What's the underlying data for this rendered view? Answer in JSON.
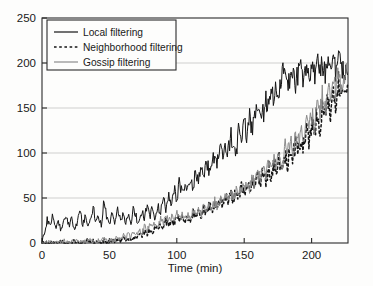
{
  "chart_data": {
    "type": "line",
    "title": "",
    "xlabel": "Time (min)",
    "ylabel": "",
    "xlim": [
      0,
      227
    ],
    "ylim": [
      0,
      250
    ],
    "xticks": [
      0,
      50,
      100,
      150,
      200
    ],
    "yticks": [
      0,
      50,
      100,
      150,
      200,
      250
    ],
    "xtick_labels": [
      "0",
      "50",
      "100",
      "150",
      "200"
    ],
    "ytick_labels": [
      "0",
      "50",
      "100",
      "150",
      "200",
      "250"
    ],
    "grid": "horizontal",
    "legend_position": "upper-left",
    "series": [
      {
        "name": "Local filtering",
        "style": "solid",
        "color": "#141414",
        "x": [
          0,
          2,
          4,
          6,
          8,
          10,
          12,
          14,
          16,
          18,
          20,
          22,
          24,
          26,
          28,
          30,
          32,
          34,
          36,
          38,
          40,
          42,
          44,
          46,
          48,
          50,
          52,
          54,
          56,
          58,
          60,
          62,
          64,
          66,
          68,
          70,
          72,
          74,
          76,
          78,
          80,
          82,
          84,
          86,
          88,
          90,
          92,
          94,
          96,
          98,
          100,
          102,
          104,
          106,
          108,
          110,
          112,
          114,
          116,
          118,
          120,
          122,
          124,
          126,
          128,
          130,
          132,
          134,
          136,
          138,
          140,
          142,
          144,
          146,
          148,
          150,
          152,
          154,
          156,
          158,
          160,
          162,
          164,
          166,
          168,
          170,
          172,
          174,
          176,
          178,
          180,
          182,
          184,
          186,
          188,
          190,
          192,
          194,
          196,
          198,
          200,
          202,
          204,
          206,
          208,
          210,
          212,
          214,
          216,
          218,
          220,
          222,
          224,
          226
        ],
        "y": [
          2,
          14,
          26,
          20,
          31,
          17,
          28,
          12,
          24,
          33,
          19,
          27,
          14,
          22,
          36,
          21,
          30,
          16,
          25,
          40,
          23,
          31,
          18,
          48,
          27,
          20,
          34,
          22,
          38,
          25,
          31,
          19,
          36,
          24,
          41,
          28,
          22,
          35,
          26,
          44,
          30,
          38,
          25,
          42,
          33,
          49,
          36,
          55,
          41,
          62,
          47,
          70,
          52,
          58,
          64,
          73,
          59,
          81,
          66,
          88,
          72,
          94,
          79,
          86,
          101,
          92,
          108,
          96,
          114,
          103,
          121,
          110,
          99,
          127,
          116,
          134,
          122,
          141,
          129,
          148,
          136,
          155,
          143,
          162,
          150,
          168,
          157,
          176,
          168,
          188,
          205,
          182,
          173,
          190,
          178,
          186,
          195,
          183,
          191,
          180,
          196,
          186,
          203,
          191,
          198,
          187,
          206,
          194,
          201,
          190,
          212,
          198,
          186,
          196
        ],
        "final_value": 196
      },
      {
        "name": "Neighborhood filtering",
        "style": "dashed",
        "color": "#141414",
        "x": [
          0,
          2,
          4,
          6,
          8,
          10,
          12,
          14,
          16,
          18,
          20,
          22,
          24,
          26,
          28,
          30,
          32,
          34,
          36,
          38,
          40,
          42,
          44,
          46,
          48,
          50,
          52,
          54,
          56,
          58,
          60,
          62,
          64,
          66,
          68,
          70,
          72,
          74,
          76,
          78,
          80,
          82,
          84,
          86,
          88,
          90,
          92,
          94,
          96,
          98,
          100,
          102,
          104,
          106,
          108,
          110,
          112,
          114,
          116,
          118,
          120,
          122,
          124,
          126,
          128,
          130,
          132,
          134,
          136,
          138,
          140,
          142,
          144,
          146,
          148,
          150,
          152,
          154,
          156,
          158,
          160,
          162,
          164,
          166,
          168,
          170,
          172,
          174,
          176,
          178,
          180,
          182,
          184,
          186,
          188,
          190,
          192,
          194,
          196,
          198,
          200,
          202,
          204,
          206,
          208,
          210,
          212,
          214,
          216,
          218,
          220,
          222,
          224,
          226
        ],
        "y": [
          0,
          0,
          0,
          1,
          0,
          1,
          0,
          2,
          1,
          0,
          1,
          0,
          2,
          1,
          0,
          2,
          1,
          3,
          1,
          2,
          0,
          2,
          1,
          3,
          2,
          1,
          3,
          2,
          4,
          2,
          5,
          3,
          6,
          4,
          8,
          5,
          10,
          7,
          13,
          9,
          16,
          12,
          19,
          14,
          22,
          17,
          25,
          20,
          28,
          22,
          31,
          25,
          27,
          23,
          30,
          26,
          33,
          28,
          36,
          30,
          39,
          33,
          42,
          35,
          45,
          38,
          48,
          41,
          52,
          44,
          56,
          48,
          60,
          51,
          64,
          55,
          68,
          58,
          72,
          61,
          76,
          65,
          80,
          68,
          85,
          72,
          90,
          76,
          95,
          81,
          100,
          86,
          106,
          91,
          112,
          97,
          120,
          104,
          128,
          112,
          136,
          120,
          145,
          128,
          154,
          136,
          163,
          145,
          172,
          154,
          180,
          163,
          172,
          180
        ],
        "final_value": 180
      },
      {
        "name": "Gossip filtering",
        "style": "solid",
        "color": "#8c8c8c",
        "x": [
          0,
          2,
          4,
          6,
          8,
          10,
          12,
          14,
          16,
          18,
          20,
          22,
          24,
          26,
          28,
          30,
          32,
          34,
          36,
          38,
          40,
          42,
          44,
          46,
          48,
          50,
          52,
          54,
          56,
          58,
          60,
          62,
          64,
          66,
          68,
          70,
          72,
          74,
          76,
          78,
          80,
          82,
          84,
          86,
          88,
          90,
          92,
          94,
          96,
          98,
          100,
          102,
          104,
          106,
          108,
          110,
          112,
          114,
          116,
          118,
          120,
          122,
          124,
          126,
          128,
          130,
          132,
          134,
          136,
          138,
          140,
          142,
          144,
          146,
          148,
          150,
          152,
          154,
          156,
          158,
          160,
          162,
          164,
          166,
          168,
          170,
          172,
          174,
          176,
          178,
          180,
          182,
          184,
          186,
          188,
          190,
          192,
          194,
          196,
          198,
          200,
          202,
          204,
          206,
          208,
          210,
          212,
          214,
          216,
          218,
          220,
          222,
          224,
          226
        ],
        "y": [
          0,
          1,
          0,
          2,
          1,
          0,
          2,
          1,
          3,
          1,
          0,
          2,
          1,
          4,
          2,
          1,
          3,
          2,
          5,
          2,
          1,
          3,
          2,
          6,
          3,
          2,
          4,
          3,
          7,
          4,
          9,
          5,
          11,
          6,
          13,
          8,
          16,
          10,
          19,
          12,
          22,
          15,
          25,
          18,
          28,
          20,
          30,
          23,
          29,
          25,
          32,
          27,
          30,
          28,
          33,
          29,
          35,
          31,
          37,
          32,
          40,
          34,
          43,
          36,
          46,
          39,
          49,
          42,
          53,
          45,
          57,
          49,
          61,
          52,
          66,
          56,
          70,
          60,
          75,
          64,
          80,
          68,
          85,
          72,
          90,
          77,
          96,
          82,
          102,
          88,
          108,
          94,
          115,
          100,
          122,
          107,
          130,
          114,
          138,
          122,
          146,
          130,
          155,
          138,
          164,
          147,
          173,
          156,
          182,
          166,
          190,
          175,
          185,
          192
        ],
        "final_value": 192
      }
    ],
    "legend_entries": [
      {
        "label": "Local filtering",
        "style": "solid",
        "color": "#141414"
      },
      {
        "label": "Neighborhood filtering",
        "style": "dashed",
        "color": "#141414"
      },
      {
        "label": "Gossip filtering",
        "style": "solid",
        "color": "#8c8c8c"
      }
    ]
  },
  "colors": {
    "axis": "#2b2b2b",
    "grid": "#c9c9c9",
    "background": "#fdfdfc",
    "local": "#141414",
    "neighborhood": "#141414",
    "gossip": "#8c8c8c"
  },
  "axis": {
    "x_label": "Time (min)",
    "y_label": ""
  }
}
